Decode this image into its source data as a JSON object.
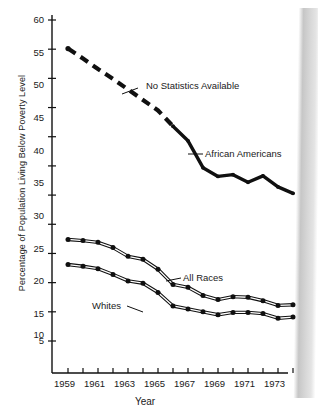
{
  "chart_data": {
    "type": "line",
    "title": "",
    "xlabel": "Year",
    "ylabel": "Percentage of Population Living Below Poverty Level",
    "xlim": [
      1958.6,
      1974.6
    ],
    "ylim": [
      0,
      61
    ],
    "ytick_values": [
      5,
      10,
      15,
      20,
      25,
      30,
      35,
      40,
      45,
      50,
      55,
      60
    ],
    "ytick_labels": [
      "5",
      "10",
      "15",
      "20",
      "25",
      "30",
      "35",
      "40",
      "45",
      "50",
      "55",
      "60"
    ],
    "xtick_values": [
      1959,
      1960,
      1961,
      1962,
      1963,
      1964,
      1965,
      1966,
      1967,
      1968,
      1969,
      1970,
      1971,
      1972,
      1973,
      1974
    ],
    "xtick_labels": [
      "1959",
      "",
      "1961",
      "",
      "1963",
      "",
      "1965",
      "",
      "1967",
      "",
      "1969",
      "",
      "1971",
      "",
      "1973",
      ""
    ],
    "grid": false,
    "legend_position": "inline-annotations",
    "x": [
      1959,
      1960,
      1961,
      1962,
      1963,
      1964,
      1965,
      1966,
      1967,
      1968,
      1969,
      1970,
      1971,
      1972,
      1973,
      1974
    ],
    "series": [
      {
        "name": "African Americans",
        "style": "thick-line",
        "dashed_through": 1965,
        "dash_note": "No Statistics Available",
        "markers": false,
        "values": [
          55.1,
          53.4,
          51.6,
          49.9,
          48.1,
          46.3,
          44.5,
          41.8,
          39.3,
          34.7,
          33.2,
          33.5,
          32.2,
          33.3,
          31.4,
          30.3
        ]
      },
      {
        "name": "All Races",
        "style": "double-line-with-dots",
        "markers": true,
        "values": [
          22.4,
          22.2,
          21.9,
          21.0,
          19.5,
          19.0,
          17.3,
          14.7,
          14.2,
          12.8,
          12.1,
          12.6,
          12.5,
          11.9,
          11.1,
          11.2
        ]
      },
      {
        "name": "Whites",
        "style": "double-line-with-dots",
        "markers": true,
        "values": [
          18.1,
          17.8,
          17.4,
          16.4,
          15.3,
          14.9,
          13.3,
          11.0,
          10.5,
          10.0,
          9.5,
          9.9,
          9.9,
          9.7,
          8.9,
          9.1
        ]
      }
    ],
    "annotations": [
      {
        "text": "No Statistics Available",
        "series": "African Americans",
        "at_x": 1963
      },
      {
        "text": "African Americans",
        "series": "African Americans",
        "at_x": 1967
      },
      {
        "text": "All Races",
        "series": "All Races",
        "at_x": 1967
      },
      {
        "text": "Whites",
        "series": "Whites",
        "at_x": 1966
      }
    ]
  },
  "axis": {
    "y_label": "Percentage of Population Living Below Poverty Level",
    "x_label": "Year",
    "y_ticks": [
      "60",
      "55",
      "50",
      "45",
      "40",
      "35",
      "30",
      "25",
      "20",
      "15",
      "10",
      "5"
    ],
    "x_ticks": [
      "1959",
      "1961",
      "1963",
      "1965",
      "1967",
      "1969",
      "1971",
      "1973"
    ]
  },
  "annotations": {
    "no_statistics": "No Statistics Available",
    "african_americans": "African Americans",
    "all_races": "All Races",
    "whites": "Whites"
  },
  "colors": {
    "ink": "#101010",
    "paper": "#ffffff",
    "scan_edge": "#9a9a9a"
  }
}
